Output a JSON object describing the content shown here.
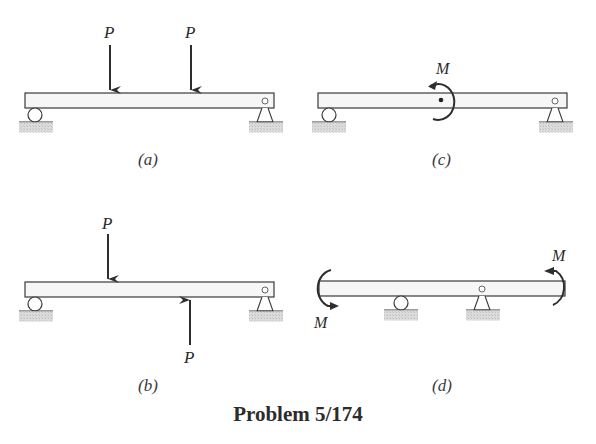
{
  "figure": {
    "title": "Problem 5/174",
    "colors": {
      "line": "#3a3a3a",
      "beam_fill": "#f6f6f6",
      "ground_fill": "#cfcfcf",
      "arrow": "#2e2e2e"
    },
    "panels": [
      {
        "id": "a",
        "caption": "(a)",
        "loads": [
          {
            "type": "force",
            "label": "P",
            "direction": "down",
            "position": "left-third"
          },
          {
            "type": "force",
            "label": "P",
            "direction": "down",
            "position": "right-third"
          }
        ],
        "supports": [
          {
            "type": "roller",
            "position": "left-end"
          },
          {
            "type": "pin",
            "position": "right-end"
          }
        ]
      },
      {
        "id": "b",
        "caption": "(b)",
        "loads": [
          {
            "type": "force",
            "label": "P",
            "direction": "down",
            "position": "left-third",
            "side": "top"
          },
          {
            "type": "force",
            "label": "P",
            "direction": "up",
            "position": "right-third",
            "side": "bottom"
          }
        ],
        "supports": [
          {
            "type": "roller",
            "position": "left-end"
          },
          {
            "type": "pin",
            "position": "right-end"
          }
        ]
      },
      {
        "id": "c",
        "caption": "(c)",
        "loads": [
          {
            "type": "couple",
            "label": "M",
            "sense": "counterclockwise",
            "position": "midspan"
          }
        ],
        "supports": [
          {
            "type": "roller",
            "position": "left-end"
          },
          {
            "type": "pin",
            "position": "right-end"
          }
        ]
      },
      {
        "id": "d",
        "caption": "(d)",
        "loads": [
          {
            "type": "couple",
            "label": "M",
            "sense": "counterclockwise",
            "position": "left-end"
          },
          {
            "type": "couple",
            "label": "M",
            "sense": "counterclockwise",
            "position": "right-end"
          }
        ],
        "supports": [
          {
            "type": "roller",
            "position": "inner-left"
          },
          {
            "type": "pin",
            "position": "inner-right"
          }
        ]
      }
    ]
  }
}
